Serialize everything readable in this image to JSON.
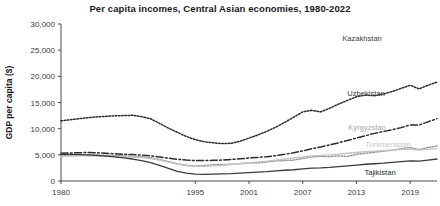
{
  "chart_data": {
    "type": "line",
    "title": "Per capita incomes, Central Asian economies, 1980-2022",
    "xlabel": "",
    "ylabel": "GDP per capita ($)",
    "xlim": [
      1980,
      2022
    ],
    "ylim": [
      0,
      30000
    ],
    "grid": false,
    "legend_position": "inline-right-labels",
    "ytick_labels": [
      "30,000",
      "25,000",
      "20,000",
      "15,000",
      "10,000",
      "5,000",
      "0"
    ],
    "ytick_values": [
      30000,
      25000,
      20000,
      15000,
      10000,
      5000,
      0
    ],
    "xtick_labels": [
      "1980",
      "1995",
      "2001",
      "2007",
      "2013",
      "2019"
    ],
    "xtick_values": [
      1980,
      1995,
      2001,
      2007,
      2013,
      2019
    ],
    "x": [
      1980,
      1981,
      1982,
      1983,
      1984,
      1985,
      1986,
      1987,
      1988,
      1989,
      1990,
      1991,
      1992,
      1993,
      1994,
      1995,
      1996,
      1997,
      1998,
      1999,
      2000,
      2001,
      2002,
      2003,
      2004,
      2005,
      2006,
      2007,
      2008,
      2009,
      2010,
      2011,
      2012,
      2013,
      2014,
      2015,
      2016,
      2017,
      2018,
      2019,
      2020,
      2021,
      2022
    ],
    "series": [
      {
        "name": "Kazakhstan",
        "color": "#2b2b2b",
        "style": "dotted",
        "label_color": "#3b3b3b",
        "values": [
          11500,
          11700,
          11900,
          12100,
          12250,
          12350,
          12450,
          12500,
          12550,
          12300,
          11900,
          11000,
          10100,
          9300,
          8500,
          7900,
          7500,
          7300,
          7150,
          7200,
          7600,
          8200,
          8800,
          9500,
          10300,
          11200,
          12200,
          13200,
          13500,
          13200,
          13900,
          14700,
          15400,
          16100,
          16400,
          16300,
          16600,
          17100,
          17700,
          18300,
          17600,
          18300,
          18900
        ]
      },
      {
        "name": "Uzbekistan",
        "color": "#2b2b2b",
        "style": "dashdot",
        "label_color": "#3b3b3b",
        "values": [
          5300,
          5350,
          5400,
          5450,
          5400,
          5300,
          5200,
          5100,
          5050,
          4950,
          4800,
          4600,
          4350,
          4150,
          4000,
          3900,
          3900,
          3950,
          4000,
          4100,
          4250,
          4400,
          4500,
          4650,
          4850,
          5100,
          5400,
          5750,
          6150,
          6500,
          6900,
          7300,
          7750,
          8200,
          8650,
          9100,
          9450,
          9800,
          10200,
          10700,
          10700,
          11300,
          11900
        ]
      },
      {
        "name": "Kyrgyzstan",
        "color": "#9a9a9a",
        "style": "dotted",
        "label_color": "#a8a8a8",
        "values": [
          4900,
          4950,
          5000,
          5000,
          4950,
          4900,
          4850,
          4800,
          4750,
          4650,
          4450,
          4100,
          3700,
          3300,
          3000,
          2850,
          2950,
          3100,
          3150,
          3200,
          3300,
          3450,
          3450,
          3650,
          3850,
          3900,
          4000,
          4300,
          4600,
          4700,
          4650,
          4800,
          4700,
          5100,
          5300,
          5500,
          5700,
          5900,
          6150,
          6400,
          6000,
          6400,
          6700
        ]
      },
      {
        "name": "Turkmenistan",
        "color": "#c4c4c4",
        "style": "solid",
        "label_color": "#c8c8c8",
        "values": [
          4700,
          4750,
          4800,
          4800,
          4750,
          4700,
          4650,
          4600,
          4550,
          4450,
          4300,
          4000,
          3600,
          3250,
          2950,
          2800,
          2800,
          2900,
          3000,
          3150,
          3350,
          3500,
          3650,
          3800,
          4000,
          4200,
          4400,
          4600,
          4800,
          4900,
          5000,
          5150,
          5300,
          5450,
          5600,
          5700,
          5800,
          5900,
          6000,
          6100,
          5900,
          6050,
          6200
        ]
      },
      {
        "name": "Tajikistan",
        "color": "#3a3a3a",
        "style": "solid",
        "label_color": "#1f1f1f",
        "values": [
          5100,
          5100,
          5050,
          5000,
          4900,
          4750,
          4600,
          4400,
          4200,
          3900,
          3500,
          3000,
          2400,
          1850,
          1500,
          1300,
          1280,
          1300,
          1350,
          1400,
          1500,
          1600,
          1700,
          1800,
          1950,
          2050,
          2150,
          2300,
          2450,
          2500,
          2600,
          2750,
          2900,
          3050,
          3200,
          3300,
          3400,
          3550,
          3700,
          3850,
          3800,
          4000,
          4200
        ]
      }
    ],
    "series_label_positions": [
      {
        "name": "Kazakhstan",
        "x": 362,
        "y": 41
      },
      {
        "name": "Uzbekistan",
        "x": 366,
        "y": 96
      },
      {
        "name": "Kyrgyzstan",
        "x": 367,
        "y": 130
      },
      {
        "name": "Turkmenistan",
        "x": 388,
        "y": 147
      },
      {
        "name": "Tajikistan",
        "x": 380,
        "y": 175
      }
    ]
  }
}
